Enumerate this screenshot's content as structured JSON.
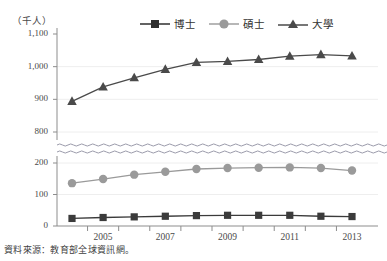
{
  "chart_data": {
    "type": "line",
    "title": "",
    "xlabel": "",
    "ylabel": "（千人）",
    "unit_label": "（千人）",
    "x": [
      2004,
      2005,
      2006,
      2007,
      2008,
      2009,
      2010,
      2011,
      2012,
      2013
    ],
    "xtick_labels": [
      "2005",
      "2007",
      "2009",
      "2011",
      "2013"
    ],
    "xtick_values": [
      2005,
      2007,
      2009,
      2011,
      2013
    ],
    "ytick_labels": [
      "1,100",
      "1,000",
      "900",
      "800",
      "200",
      "100",
      "0"
    ],
    "ytick_values": [
      1100,
      1000,
      900,
      800,
      200,
      100,
      0
    ],
    "ylim": [
      0,
      1100
    ],
    "axis_break": {
      "present": true,
      "lower": 200,
      "upper": 800,
      "style": "double-wavy"
    },
    "grid": true,
    "legend_position": "top-center",
    "series": [
      {
        "name": "博士",
        "marker": "square",
        "color": "#3b3b3b",
        "values": [
          24,
          27,
          29,
          31,
          33,
          34,
          34,
          34,
          31,
          30
        ]
      },
      {
        "name": "碩士",
        "marker": "circle",
        "color": "#9a9a9a",
        "values": [
          136,
          149,
          163,
          172,
          181,
          184,
          185,
          186,
          184,
          176
        ]
      },
      {
        "name": "大學",
        "marker": "triangle",
        "color": "#4a4a4a",
        "values": [
          894,
          938,
          966,
          992,
          1013,
          1016,
          1022,
          1032,
          1037,
          1033
        ]
      }
    ]
  },
  "source": {
    "note": "資料來源：教育部全球資訊網。"
  },
  "legend": {
    "items": [
      {
        "label": "博士",
        "marker": "square"
      },
      {
        "label": "碩士",
        "marker": "circle"
      },
      {
        "label": "大學",
        "marker": "triangle"
      }
    ]
  }
}
